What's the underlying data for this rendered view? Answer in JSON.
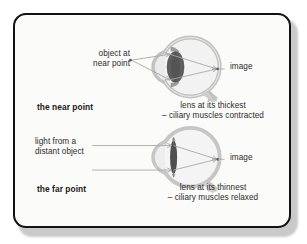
{
  "figure": {
    "title_alt": "Eye accommodation: near point and far point",
    "colors": {
      "border": "#111111",
      "card_bg": "#fbfbf9",
      "page_bg": "#ffffff",
      "shadow": "#c9c9c9",
      "eye_outline": "#b9b9b9",
      "eye_fill": "#efefef",
      "lens_thick": "#5e5e5e",
      "lens_thin": "#4f4f4f",
      "ray": "#a8a8a8",
      "text": "#2b2b2b"
    }
  },
  "near_point": {
    "object_label_line1": "object at",
    "object_label_line2": "near point",
    "image_label": "image",
    "title": "the near point",
    "caption_line1": "lens at its thickest",
    "caption_line2": "– ciliary muscles contracted"
  },
  "far_point": {
    "source_label_line1": "light from a",
    "source_label_line2": "distant object",
    "image_label": "image",
    "title": "the far point",
    "caption_line1": "lens at its thinnest",
    "caption_line2": "– ciliary muscles relaxed"
  },
  "diagram_data": {
    "type": "schematic",
    "panels": [
      {
        "name": "near-point",
        "lens_state": "thickest",
        "ciliary_muscles": "contracted",
        "incoming_rays": "diverging from near object point",
        "ray_count": 2,
        "image_position": "retina (back of eye)"
      },
      {
        "name": "far-point",
        "lens_state": "thinnest",
        "ciliary_muscles": "relaxed",
        "incoming_rays": "parallel from distant object",
        "ray_count": 2,
        "image_position": "retina (back of eye)"
      }
    ]
  }
}
